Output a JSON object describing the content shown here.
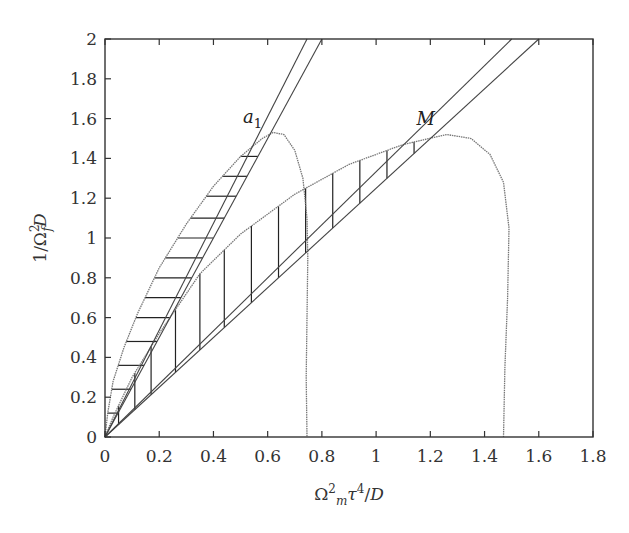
{
  "chart_data": {
    "type": "line",
    "title": "",
    "xlabel": "Ω_m^2 τ^4 / D",
    "ylabel": "1/Ω_f^2 D",
    "xlim": [
      0,
      1.8
    ],
    "ylim": [
      0,
      2
    ],
    "grid": false,
    "legend": null,
    "x_ticks": [
      "0",
      "0.2",
      "0.4",
      "0.6",
      "0.8",
      "1",
      "1.2",
      "1.4",
      "1.6",
      "1.8"
    ],
    "y_ticks": [
      "0",
      "0.2",
      "0.4",
      "0.6",
      "0.8",
      "1",
      "1.2",
      "1.4",
      "1.6",
      "1.8",
      "2"
    ],
    "annotations": [
      {
        "label": "a",
        "subscript": "1",
        "x": 0.62,
        "y": 1.53
      },
      {
        "label": "M",
        "x": 1.26,
        "y": 1.52
      }
    ],
    "series": [
      {
        "name": "boundary curve a1 (dotted)",
        "style": "dotted",
        "points": [
          [
            0,
            0
          ],
          [
            0.01,
            0.12
          ],
          [
            0.03,
            0.28
          ],
          [
            0.07,
            0.45
          ],
          [
            0.12,
            0.62
          ],
          [
            0.2,
            0.85
          ],
          [
            0.3,
            1.07
          ],
          [
            0.4,
            1.26
          ],
          [
            0.5,
            1.41
          ],
          [
            0.58,
            1.5
          ],
          [
            0.62,
            1.53
          ],
          [
            0.66,
            1.52
          ],
          [
            0.7,
            1.44
          ],
          [
            0.73,
            1.3
          ],
          [
            0.745,
            1.1
          ],
          [
            0.748,
            0.9
          ],
          [
            0.745,
            0.6
          ],
          [
            0.742,
            0.3
          ],
          [
            0.745,
            0
          ]
        ]
      },
      {
        "name": "boundary curve M (dotted)",
        "style": "dotted",
        "points": [
          [
            0,
            0
          ],
          [
            0.03,
            0.1
          ],
          [
            0.1,
            0.3
          ],
          [
            0.2,
            0.52
          ],
          [
            0.35,
            0.82
          ],
          [
            0.5,
            1.02
          ],
          [
            0.7,
            1.22
          ],
          [
            0.9,
            1.37
          ],
          [
            1.1,
            1.47
          ],
          [
            1.26,
            1.52
          ],
          [
            1.35,
            1.5
          ],
          [
            1.42,
            1.42
          ],
          [
            1.47,
            1.28
          ],
          [
            1.49,
            1.05
          ],
          [
            1.485,
            0.7
          ],
          [
            1.475,
            0.35
          ],
          [
            1.47,
            0
          ]
        ]
      },
      {
        "name": "line through a1 (steep)",
        "style": "solid",
        "points": [
          [
            0,
            0
          ],
          [
            0.745,
            2
          ]
        ]
      },
      {
        "name": "line through a1",
        "style": "solid",
        "points": [
          [
            0,
            0
          ],
          [
            0.8,
            2
          ]
        ]
      },
      {
        "name": "line through M (steep)",
        "style": "solid",
        "points": [
          [
            0,
            0
          ],
          [
            1.5,
            2
          ]
        ]
      },
      {
        "name": "line through M",
        "style": "solid",
        "points": [
          [
            0,
            0
          ],
          [
            1.6,
            2
          ]
        ]
      }
    ],
    "hatched_regions": [
      {
        "name": "region under a1 curve",
        "hatch": "horizontal",
        "y_levels": [
          0.12,
          0.24,
          0.36,
          0.48,
          0.6,
          0.7,
          0.8,
          0.9,
          1.0,
          1.1,
          1.21,
          1.31,
          1.41
        ]
      },
      {
        "name": "region under M curve",
        "hatch": "vertical",
        "x_levels": [
          0.05,
          0.11,
          0.17,
          0.26,
          0.35,
          0.44,
          0.54,
          0.64,
          0.74,
          0.84,
          0.94,
          1.04,
          1.14
        ]
      }
    ]
  }
}
